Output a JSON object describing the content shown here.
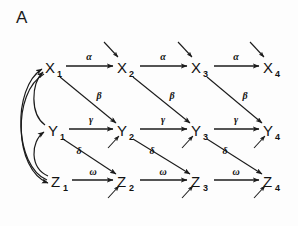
{
  "panel": {
    "label": "A",
    "background_color": "#fdfdfd",
    "ink_color": "#1b1b1b"
  },
  "diagram": {
    "type": "path-diagram",
    "rows": [
      {
        "id": "x",
        "base": "X",
        "y": 68,
        "horizontal_label": "α",
        "nodes": [
          {
            "name": "X1",
            "base": "X",
            "sub": "1",
            "x": 52
          },
          {
            "name": "X2",
            "base": "X",
            "sub": "2",
            "x": 124
          },
          {
            "name": "X3",
            "base": "X",
            "sub": "3",
            "x": 198
          },
          {
            "name": "X4",
            "base": "X",
            "sub": "4",
            "x": 270
          }
        ]
      },
      {
        "id": "y",
        "base": "Y",
        "y": 131,
        "horizontal_label": "γ",
        "nodes": [
          {
            "name": "Y1",
            "base": "Y",
            "sub": "1",
            "x": 55
          },
          {
            "name": "Y2",
            "base": "Y",
            "sub": "2",
            "x": 124
          },
          {
            "name": "Y3",
            "base": "Y",
            "sub": "3",
            "x": 198
          },
          {
            "name": "Y4",
            "base": "Y",
            "sub": "4",
            "x": 270
          }
        ]
      },
      {
        "id": "z",
        "base": "Z",
        "y": 182,
        "horizontal_label": "ω",
        "nodes": [
          {
            "name": "Z1",
            "base": "Z",
            "sub": "1",
            "x": 58
          },
          {
            "name": "Z2",
            "base": "Z",
            "sub": "2",
            "x": 124
          },
          {
            "name": "Z3",
            "base": "Z",
            "sub": "3",
            "x": 198
          },
          {
            "name": "Z4",
            "base": "Z",
            "sub": "4",
            "x": 270
          }
        ]
      }
    ],
    "diagonal_labels": {
      "x_to_y": "β",
      "y_to_z": "δ"
    },
    "horizontal_labels": {
      "alpha": "α",
      "gamma": "γ",
      "omega": "ω"
    },
    "edge_label_list": [
      "α",
      "α",
      "α",
      "β",
      "β",
      "β",
      "γ",
      "γ",
      "γ",
      "δ",
      "δ",
      "δ",
      "ω",
      "ω",
      "ω"
    ],
    "feedback_arcs": [
      {
        "from": "Z1",
        "to": "Y1"
      },
      {
        "from": "Z1",
        "to": "X1"
      },
      {
        "from": "Y1",
        "to": "X1"
      }
    ],
    "disturbance_arrows": {
      "x_row": [
        "X2",
        "X3",
        "X4"
      ],
      "y_row_upper": [
        "Y2",
        "Y3",
        "Y4"
      ],
      "y_row_lower": [
        "Y2",
        "Y3",
        "Y4"
      ],
      "z_row": [
        "Z2",
        "Z3",
        "Z4"
      ]
    }
  }
}
